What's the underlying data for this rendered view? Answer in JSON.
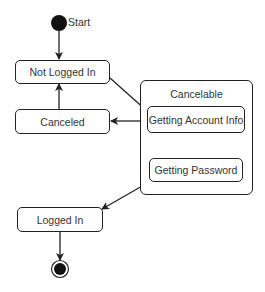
{
  "diagram": {
    "type": "uml-state-machine",
    "initial": {
      "label": "Start"
    },
    "states": [
      {
        "id": "not_logged_in",
        "label": "Not Logged In"
      },
      {
        "id": "canceled",
        "label": "Canceled"
      },
      {
        "id": "logged_in",
        "label": "Logged In"
      }
    ],
    "composite": {
      "id": "cancelable",
      "label": "Cancelable",
      "substates": [
        {
          "id": "getting_account_info",
          "label": "Getting Account Info"
        },
        {
          "id": "getting_password",
          "label": "Getting Password"
        }
      ]
    },
    "transitions": [
      {
        "from": "start",
        "to": "not_logged_in"
      },
      {
        "from": "not_logged_in",
        "to": "getting_account_info"
      },
      {
        "from": "cancelable",
        "to": "canceled"
      },
      {
        "from": "canceled",
        "to": "not_logged_in"
      },
      {
        "from": "getting_account_info",
        "to": "getting_password"
      },
      {
        "from": "getting_password",
        "to": "logged_in"
      },
      {
        "from": "logged_in",
        "to": "final"
      }
    ],
    "colors": {
      "stroke": "#222222",
      "text": "#333333",
      "background": "#ffffff"
    }
  }
}
